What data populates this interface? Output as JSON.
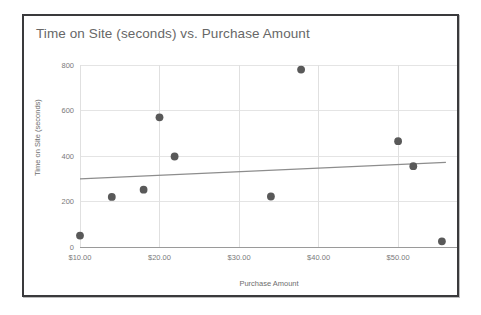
{
  "card": {
    "border_color": "#3a3a3c",
    "background": "#ffffff"
  },
  "chart_data": {
    "type": "scatter",
    "title": "Time on Site (seconds) vs. Purchase Amount",
    "xlabel": "Purchase Amount",
    "ylabel": "Time on Site (seconds)",
    "xlim": [
      10,
      57.4
    ],
    "ylim": [
      0,
      800
    ],
    "grid": true,
    "legend": false,
    "x_tick_labels": [
      "$10.00",
      "$20.00",
      "$30.00",
      "$40.00",
      "$50.00"
    ],
    "x_ticks": [
      10,
      20,
      30,
      40,
      50
    ],
    "y_tick_labels": [
      "0",
      "200",
      "400",
      "600",
      "800"
    ],
    "y_ticks": [
      0,
      200,
      400,
      600,
      800
    ],
    "point_color": "#595959",
    "trendline_color": "#8d8d8d",
    "points": [
      {
        "x": 10.0,
        "y": 50
      },
      {
        "x": 14.0,
        "y": 220
      },
      {
        "x": 18.0,
        "y": 252
      },
      {
        "x": 20.0,
        "y": 570
      },
      {
        "x": 21.9,
        "y": 398
      },
      {
        "x": 34.0,
        "y": 222
      },
      {
        "x": 37.8,
        "y": 780
      },
      {
        "x": 50.0,
        "y": 465
      },
      {
        "x": 51.9,
        "y": 355
      },
      {
        "x": 55.5,
        "y": 25
      }
    ],
    "trendline": {
      "x0": 10.0,
      "y0": 300,
      "x1": 56.0,
      "y1": 372
    }
  }
}
